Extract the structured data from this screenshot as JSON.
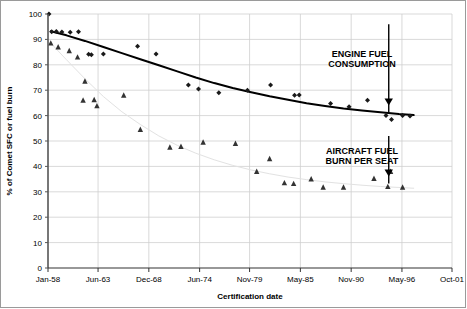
{
  "chart_data": {
    "type": "scatter",
    "title": "",
    "xlabel": "Certification date",
    "ylabel": "% of Comet SFC or fuel burn",
    "ylim": [
      0,
      100
    ],
    "ytick_values": [
      0,
      10,
      20,
      30,
      40,
      50,
      60,
      70,
      80,
      90,
      100
    ],
    "ytick_labels": [
      "0",
      "10",
      "20",
      "30",
      "40",
      "50",
      "60",
      "70",
      "80",
      "90",
      "100"
    ],
    "xtick_labels": [
      "Jan-58",
      "Jun-63",
      "Dec-68",
      "Jun-74",
      "Nov-79",
      "May-85",
      "Nov-90",
      "May-96",
      "Oct-01"
    ],
    "xtick_years": [
      1958.0,
      1963.42,
      1968.92,
      1974.42,
      1979.83,
      1985.33,
      1990.83,
      1996.33,
      2001.75
    ],
    "xlim_years": [
      1958.0,
      2001.75
    ],
    "grid": true,
    "legend": "none",
    "annotations": [
      {
        "id": "engine-fuel-consumption",
        "text_line1": "ENGINE FUEL",
        "text_line2": "CONSUMPTION",
        "x_year": 1992.0,
        "y_text": 83,
        "arrow_x_year": 1994.9,
        "arrow_y_top": 96,
        "arrow_y_tip": 64
      },
      {
        "id": "aircraft-fuel-burn-per-seat",
        "text_line1": "AIRCRAFT FUEL",
        "text_line2": "BURN PER SEAT",
        "x_year": 1992.0,
        "y_text": 45,
        "arrow_x_year": 1994.9,
        "arrow_y_top": 52,
        "arrow_y_tip": 36
      }
    ],
    "series": [
      {
        "name": "Engine fuel consumption (SFC)",
        "marker": "diamond",
        "color": "#1a1a1a",
        "points": [
          [
            1958.1,
            100.0
          ],
          [
            1958.4,
            93.0
          ],
          [
            1958.9,
            93.1
          ],
          [
            1959.5,
            92.9
          ],
          [
            1960.4,
            92.8
          ],
          [
            1961.3,
            93.0
          ],
          [
            1962.4,
            84.2
          ],
          [
            1962.7,
            84.0
          ],
          [
            1964.0,
            84.3
          ],
          [
            1967.7,
            87.3
          ],
          [
            1969.7,
            84.3
          ],
          [
            1973.2,
            72.0
          ],
          [
            1974.3,
            70.5
          ],
          [
            1976.5,
            69.0
          ],
          [
            1979.6,
            70.0
          ],
          [
            1982.1,
            72.0
          ],
          [
            1984.7,
            68.0
          ],
          [
            1985.2,
            68.1
          ],
          [
            1988.6,
            64.8
          ],
          [
            1990.6,
            63.5
          ],
          [
            1992.6,
            66.0
          ],
          [
            1994.6,
            60.0
          ],
          [
            1995.2,
            58.5
          ],
          [
            1996.4,
            60.0
          ],
          [
            1997.2,
            59.8
          ]
        ]
      },
      {
        "name": "Aircraft fuel burn per seat",
        "marker": "triangle",
        "color": "#333333",
        "points": [
          [
            1958.3,
            88.5
          ],
          [
            1959.1,
            87.0
          ],
          [
            1960.3,
            85.5
          ],
          [
            1961.2,
            83.0
          ],
          [
            1962.0,
            73.5
          ],
          [
            1961.8,
            66.0
          ],
          [
            1963.0,
            66.2
          ],
          [
            1963.3,
            63.8
          ],
          [
            1966.2,
            68.0
          ],
          [
            1968.0,
            54.5
          ],
          [
            1971.2,
            47.5
          ],
          [
            1972.4,
            47.8
          ],
          [
            1974.8,
            49.5
          ],
          [
            1978.3,
            49.0
          ],
          [
            1980.6,
            38.0
          ],
          [
            1983.6,
            33.5
          ],
          [
            1984.6,
            33.2
          ],
          [
            1986.5,
            35.0
          ],
          [
            1987.8,
            31.8
          ],
          [
            1990.0,
            31.8
          ],
          [
            1993.3,
            35.2
          ],
          [
            1994.8,
            32.0
          ],
          [
            1995.1,
            38.0
          ],
          [
            1996.4,
            31.8
          ],
          [
            1982.0,
            43.0
          ]
        ]
      }
    ],
    "trend_lines": [
      {
        "name": "engine-sfc-trend",
        "style": "solid",
        "color": "#000000",
        "width": 2.0,
        "points": [
          [
            1958.3,
            93.2
          ],
          [
            1960.0,
            91.6
          ],
          [
            1962.0,
            89.4
          ],
          [
            1964.0,
            87.0
          ],
          [
            1966.0,
            84.6
          ],
          [
            1968.0,
            82.2
          ],
          [
            1970.0,
            79.8
          ],
          [
            1972.0,
            77.4
          ],
          [
            1974.0,
            75.0
          ],
          [
            1976.0,
            72.8
          ],
          [
            1978.0,
            70.9
          ],
          [
            1980.0,
            69.2
          ],
          [
            1982.0,
            67.6
          ],
          [
            1984.0,
            66.2
          ],
          [
            1986.0,
            64.9
          ],
          [
            1988.0,
            63.8
          ],
          [
            1990.0,
            62.8
          ],
          [
            1992.0,
            62.0
          ],
          [
            1994.0,
            61.3
          ],
          [
            1996.0,
            60.6
          ],
          [
            1997.6,
            60.2
          ]
        ]
      },
      {
        "name": "aircraft-fuel-burn-trend",
        "style": "solid",
        "color": "#e2e2e2",
        "width": 1.0,
        "points": [
          [
            1958.3,
            88.5
          ],
          [
            1960.0,
            82.0
          ],
          [
            1962.0,
            74.5
          ],
          [
            1964.0,
            67.5
          ],
          [
            1966.0,
            61.5
          ],
          [
            1968.0,
            56.5
          ],
          [
            1970.0,
            52.0
          ],
          [
            1972.0,
            48.3
          ],
          [
            1974.0,
            45.2
          ],
          [
            1976.0,
            42.6
          ],
          [
            1978.0,
            40.4
          ],
          [
            1980.0,
            38.6
          ],
          [
            1982.0,
            37.1
          ],
          [
            1984.0,
            35.8
          ],
          [
            1986.0,
            34.8
          ],
          [
            1988.0,
            33.9
          ],
          [
            1990.0,
            33.2
          ],
          [
            1992.0,
            32.6
          ],
          [
            1994.0,
            32.1
          ],
          [
            1996.0,
            31.7
          ],
          [
            1997.6,
            31.4
          ]
        ]
      }
    ]
  }
}
